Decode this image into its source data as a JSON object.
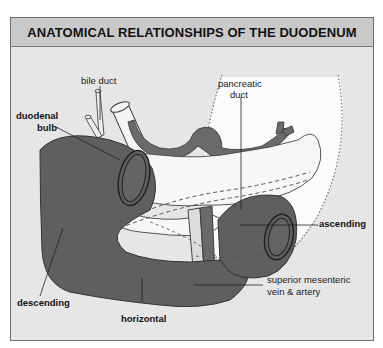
{
  "title": "ANATOMICAL RELATIONSHIPS OF THE DUODENUM",
  "colors": {
    "panel_bg": "#e6e6e6",
    "title_bg": "#c9c9c9",
    "duodenum": "#5f5f5f",
    "vessels": "#6a6a6a",
    "pancreas": "#f7f7f7",
    "outline": "#333333"
  },
  "labels": {
    "bile_duct": "bile duct",
    "pancreatic_duct_1": "pancreatic",
    "pancreatic_duct_2": "duct",
    "duodenal_bulb_1": "duodenal",
    "duodenal_bulb_2": "bulb",
    "ascending": "ascending",
    "sma_1": "superior mesenteric",
    "sma_2": "vein & artery",
    "descending": "descending",
    "horizontal": "horizontal"
  }
}
